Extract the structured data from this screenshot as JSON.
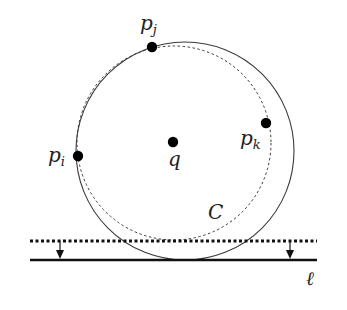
{
  "diagram": {
    "type": "geometry",
    "colors": {
      "stroke": "#3a3a3a",
      "point": "#000000",
      "label": "#222222"
    },
    "points": [
      {
        "id": "p_i",
        "base": "p",
        "sub": "i",
        "x": 78,
        "y": 156,
        "label_x": 48,
        "label_y": 162
      },
      {
        "id": "p_j",
        "base": "p",
        "sub": "j",
        "x": 152,
        "y": 47,
        "label_x": 140,
        "label_y": 30
      },
      {
        "id": "p_k",
        "base": "p",
        "sub": "k",
        "x": 266,
        "y": 123,
        "label_x": 240,
        "label_y": 145
      },
      {
        "id": "q",
        "base": "q",
        "sub": "",
        "x": 173,
        "y": 142,
        "label_x": 168,
        "label_y": 166
      }
    ],
    "circles": [
      {
        "id": "dotted-circle",
        "cx": 174,
        "cy": 143,
        "r": 97,
        "style": "dotted"
      },
      {
        "id": "solid-circle-C",
        "cx": 185,
        "cy": 151,
        "r": 109,
        "style": "solid"
      }
    ],
    "circle_label": {
      "text": "C",
      "x": 208,
      "y": 219
    },
    "lines": [
      {
        "id": "dotted-line",
        "x1": 30,
        "x2": 317,
        "y": 241,
        "style": "dotted"
      },
      {
        "id": "line-l",
        "x1": 30,
        "x2": 317,
        "y": 260,
        "style": "solid"
      }
    ],
    "arrows": [
      {
        "id": "left-arrow",
        "x": 60,
        "y1": 241,
        "y2": 260
      },
      {
        "id": "right-arrow",
        "x": 290,
        "y1": 241,
        "y2": 260
      }
    ],
    "line_label": {
      "text": "ℓ",
      "x": 306,
      "y": 285
    }
  }
}
